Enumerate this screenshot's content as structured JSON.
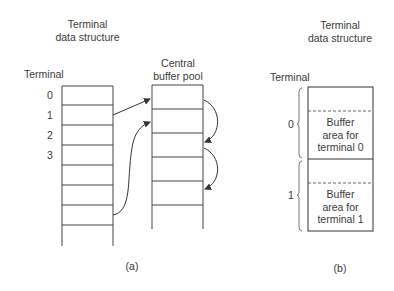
{
  "panel_a": {
    "title_line1": "Terminal",
    "title_line2": "data structure",
    "row_header": "Terminal",
    "row_labels": [
      "0",
      "1",
      "2",
      "3"
    ],
    "pool_title_line1": "Central",
    "pool_title_line2": "buffer pool",
    "caption": "(a)"
  },
  "panel_b": {
    "title_line1": "Terminal",
    "title_line2": "data structure",
    "row_header": "Terminal",
    "row_labels": [
      "0",
      "1"
    ],
    "buffers": [
      {
        "line1": "Buffer",
        "line2": "area for",
        "line3": "terminal 0"
      },
      {
        "line1": "Buffer",
        "line2": "area for",
        "line3": "terminal 1"
      }
    ],
    "caption": "(b)"
  }
}
